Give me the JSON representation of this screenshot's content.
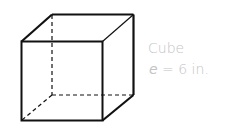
{
  "figure": {
    "shape": "Cube",
    "edge_label": {
      "variable": "e",
      "equals": " = ",
      "value": "6 in."
    }
  },
  "colors": {
    "edges": "#111111",
    "label_text": "#c4c4c4"
  }
}
